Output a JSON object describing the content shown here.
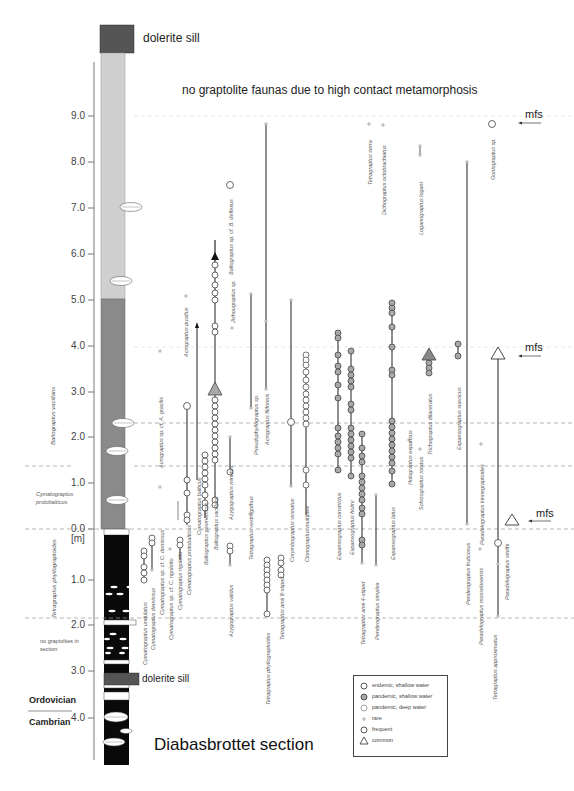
{
  "header": {
    "cut_text": "[cut off at top-left]"
  },
  "title": "Diabasbrottet section",
  "top_note": "no graptolite faunas due to high contact metamorphosis",
  "dolerite_labels": {
    "top": "dolerite sill",
    "bottom": "dolerite sill"
  },
  "axis": {
    "upper_ticks": [
      "9.0",
      "8.0",
      "7.0",
      "6.0",
      "5.0",
      "4.0",
      "3.0",
      "2.0",
      "1.0",
      "0.0"
    ],
    "unit": "[m]",
    "lower_ticks": [
      "1.0",
      "2.0",
      "3.0",
      "4.0"
    ]
  },
  "zones": {
    "vacillans": "Baltograptus vacillans",
    "protobalticus": "Cymatograptus protobalticus",
    "phyllograptoides": "Tetragraptus phyllograptoides",
    "no_graptolites": "no graptolites in section"
  },
  "periods": {
    "ordovician": "Ordovician",
    "cambrian": "Cambrian"
  },
  "mfs_label": "mfs",
  "species": [
    {
      "name": "Cymatograptus undulatus",
      "x": 144
    },
    {
      "name": "Cymatograptus demissus",
      "x": 152
    },
    {
      "name": "Cymatograptus sp. cf. C. demissus",
      "x": 161
    },
    {
      "name": "Cymatograptus sp. cf. C. rigoletto",
      "x": 170
    },
    {
      "name": "Cymatograptus rigoletto",
      "x": 179
    },
    {
      "name": "Cymatograptus protobalticus",
      "x": 188
    },
    {
      "name": "Acrograptus sp. cf. A. gracilis",
      "x": 160
    },
    {
      "name": "Cymatograptus balticus",
      "x": 197
    },
    {
      "name": "Acrograptus pusillus",
      "x": 186
    },
    {
      "name": "Baltograptus geometricus",
      "x": 205
    },
    {
      "name": "Baltograptus vacillans",
      "x": 215
    },
    {
      "name": "Azygograptus validus",
      "x": 230
    },
    {
      "name": "Azygograptus minutus",
      "x": 230
    },
    {
      "name": "Jishougraptus sp.",
      "x": 232
    },
    {
      "name": "Baltograptus sp. cf. B. deflexus",
      "x": 230
    },
    {
      "name": "Tetragraptus vestrogothus",
      "x": 250
    },
    {
      "name": "Tetragraptus phyllograptoides",
      "x": 267
    },
    {
      "name": "Tetragraptus amii 8-stiped",
      "x": 281
    },
    {
      "name": "Pseudophyllograptus sp.",
      "x": 255
    },
    {
      "name": "Acrograptus filiformis",
      "x": 267
    },
    {
      "name": "Corymbograptus vicinatus",
      "x": 290
    },
    {
      "name": "Clonograptus multiplex",
      "x": 306
    },
    {
      "name": "Expansograptus constrictus",
      "x": 338
    },
    {
      "name": "Expansograptus holmi",
      "x": 351
    },
    {
      "name": "Tetragraptus amii 4-stiped",
      "x": 362
    },
    {
      "name": "Pendeograptus simplex",
      "x": 376
    },
    {
      "name": "Expansograptus latus",
      "x": 392
    },
    {
      "name": "Tetragraptus serra",
      "x": 369
    },
    {
      "name": "Dichograptus octobrachiatus",
      "x": 383
    },
    {
      "name": "Holograptus expansus",
      "x": 409
    },
    {
      "name": "Schizograptus rotatus",
      "x": 420
    },
    {
      "name": "Trichograptus dilaceratus",
      "x": 429
    },
    {
      "name": "Loganograptus logani",
      "x": 420
    },
    {
      "name": "Expansograptus suecicus",
      "x": 458
    },
    {
      "name": "Pendeograptus fruticosus",
      "x": 467
    },
    {
      "name": "Paradelograptus kinnegraptoides",
      "x": 481
    },
    {
      "name": "Paradelograptus mosseboensis",
      "x": 480
    },
    {
      "name": "Tetragraptus approximatus",
      "x": 494
    },
    {
      "name": "Paradelograptus smithi",
      "x": 497
    },
    {
      "name": "Goniograptus sp.",
      "x": 492
    }
  ],
  "legend": {
    "items": [
      {
        "symbol": "circle-open",
        "label": "endemic, shallow water"
      },
      {
        "symbol": "circle-filled-grey",
        "label": "pandemic, shallow water"
      },
      {
        "symbol": "circle-open-thin",
        "label": "pandemic, deep water"
      },
      {
        "symbol": "dot",
        "label": "rare"
      },
      {
        "symbol": "circle-open",
        "label": "frequent"
      },
      {
        "symbol": "triangle",
        "label": "common"
      }
    ]
  },
  "colors": {
    "dolerite": "#5a5a5a",
    "light_unit": "#cfcfcf",
    "mid_unit": "#8a8a8a",
    "black_unit": "#0a0a0a",
    "pandemic_shallow": "#a8a8a8",
    "dashed_line": "#999999"
  }
}
